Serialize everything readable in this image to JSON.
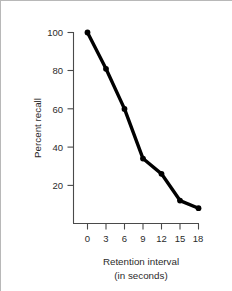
{
  "chart_data": {
    "type": "line",
    "title": "",
    "xlabel": "Retention interval",
    "xlabel_sub": "(in seconds)",
    "ylabel": "Percent recall",
    "x": [
      0,
      3,
      6,
      9,
      12,
      15,
      18
    ],
    "values": [
      100,
      81,
      60,
      34,
      26,
      12,
      8
    ],
    "series": [
      {
        "name": "Percent recall",
        "values": [
          100,
          81,
          60,
          34,
          26,
          12,
          8
        ]
      }
    ],
    "xlim": [
      0,
      18
    ],
    "ylim": [
      0,
      100
    ],
    "xticks": [
      0,
      3,
      6,
      9,
      12,
      15,
      18
    ],
    "yticks": [
      20,
      40,
      60,
      80,
      100
    ],
    "xtick_labels": [
      "0",
      "3",
      "6",
      "9",
      "12",
      "15",
      "18"
    ],
    "ytick_labels": [
      "20",
      "40",
      "60",
      "80",
      "100"
    ],
    "grid": false,
    "legend": false,
    "legend_position": "none",
    "line_color": "#000000",
    "marker": "circle",
    "axis_color": "#4a4a4a",
    "frame_color": "#b8b8b8"
  }
}
